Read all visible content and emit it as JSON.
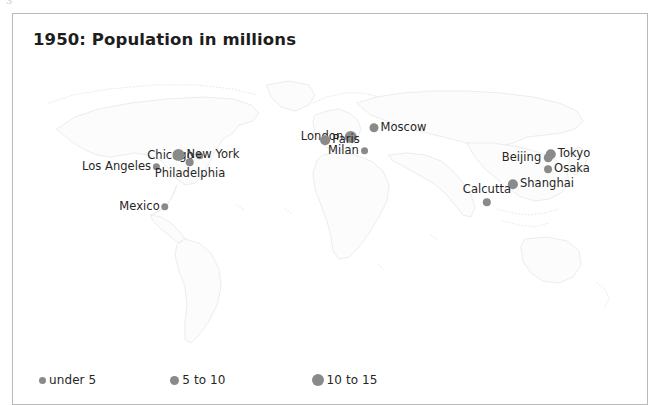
{
  "page": {
    "artifact_mark": "3",
    "background_color": "#ffffff"
  },
  "figure": {
    "title": "1950: Population in millions",
    "frame_color": "#b9b9b9",
    "marker_color": "#8a8a8a",
    "map_outline_color": "#b0b0b0"
  },
  "chart_data": {
    "type": "scatter",
    "title": "1950: Population in millions",
    "subtitle": "",
    "xlabel": "",
    "ylabel": "",
    "projection": "world-map",
    "value_units": "millions of people",
    "size_encoding": "marker diameter encodes population class",
    "classes": [
      {
        "label": "under 5",
        "min": 0,
        "max": 5,
        "dot_px": 7
      },
      {
        "label": "5 to 10",
        "min": 5,
        "max": 10,
        "dot_px": 9
      },
      {
        "label": "10 to 15",
        "min": 10,
        "max": 15,
        "dot_px": 12
      }
    ],
    "legend": {
      "position": "bottom-left",
      "entries": [
        "under 5",
        "5 to 10",
        "10 to 15"
      ]
    },
    "grid": false,
    "points": [
      {
        "name": "Los Angeles",
        "class": "under 5",
        "x": 94,
        "y": 108,
        "label_side": "left",
        "dot_px": 7
      },
      {
        "name": "Chicago",
        "class": "under 5",
        "x": 148,
        "y": 97,
        "label_side": "left",
        "dot_px": 7
      },
      {
        "name": "New York",
        "class": "10 to 15",
        "x": 179,
        "y": 96,
        "label_side": "right",
        "dot_px": 12
      },
      {
        "name": "Philadelphia",
        "class": "under 5",
        "x": 163,
        "y": 110,
        "label_side": "below",
        "dot_px": 8
      },
      {
        "name": "Mexico",
        "class": "under 5",
        "x": 117,
        "y": 148,
        "label_side": "left",
        "dot_px": 7
      },
      {
        "name": "London",
        "class": "10 to 15",
        "x": 302,
        "y": 78,
        "label_side": "left",
        "dot_px": 12
      },
      {
        "name": "Paris",
        "class": "5 to 10",
        "x": 313,
        "y": 81,
        "label_side": "right",
        "dot_px": 10
      },
      {
        "name": "Milan",
        "class": "under 5",
        "x": 321,
        "y": 92,
        "label_side": "left",
        "dot_px": 7
      },
      {
        "name": "Moscow",
        "class": "5 to 10",
        "x": 371,
        "y": 69,
        "label_side": "right",
        "dot_px": 9
      },
      {
        "name": "Beijing",
        "class": "5 to 10",
        "x": 500,
        "y": 99,
        "label_side": "left",
        "dot_px": 9
      },
      {
        "name": "Tokyo",
        "class": "5 to 10",
        "x": 541,
        "y": 95,
        "label_side": "right",
        "dot_px": 10
      },
      {
        "name": "Osaka",
        "class": "under 5",
        "x": 540,
        "y": 110,
        "label_side": "right",
        "dot_px": 8
      },
      {
        "name": "Shanghai",
        "class": "5 to 10",
        "x": 514,
        "y": 125,
        "label_side": "right",
        "dot_px": 10
      },
      {
        "name": "Calcutta",
        "class": "under 5",
        "x": 460,
        "y": 136,
        "label_side": "above",
        "dot_px": 8
      }
    ]
  }
}
